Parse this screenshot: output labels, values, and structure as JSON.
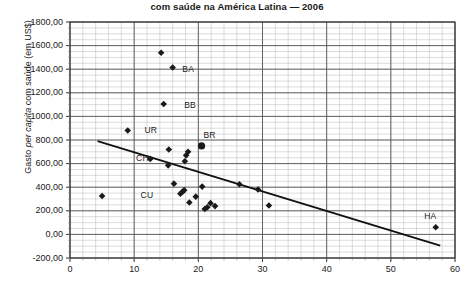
{
  "chart_data": {
    "type": "scatter",
    "title": "com saúde na América Latina — 2006",
    "xlabel": "",
    "ylabel": "Gasto per capita com saúde (em US$)",
    "xlim": [
      0,
      60
    ],
    "ylim": [
      -200,
      1800
    ],
    "xticks": [
      0,
      10,
      20,
      30,
      40,
      50,
      60
    ],
    "xtick_labels": [
      "0",
      "10",
      "20",
      "30",
      "40",
      "50",
      "60"
    ],
    "yticks": [
      -200,
      0,
      200,
      400,
      600,
      800,
      1000,
      1200,
      1400,
      1600,
      1800
    ],
    "ytick_labels": [
      "-200,00",
      "0,00",
      "200,00",
      "400,00",
      "600,00",
      "800,00",
      "1000,00",
      "1200,00",
      "1400,00",
      "1600,00",
      "1800,00"
    ],
    "grid": true,
    "grid_minor_x_step": 2,
    "grid_minor_y_step": 50,
    "marker_color": "#1a1a1a",
    "line_color": "#111111",
    "points": [
      {
        "x": 5.0,
        "y": 325,
        "label": ""
      },
      {
        "x": 9.0,
        "y": 880,
        "label": ""
      },
      {
        "x": 12.5,
        "y": 640,
        "label": ""
      },
      {
        "x": 14.2,
        "y": 1540,
        "label": ""
      },
      {
        "x": 14.6,
        "y": 1105,
        "label": ""
      },
      {
        "x": 15.3,
        "y": 585,
        "label": ""
      },
      {
        "x": 15.4,
        "y": 720,
        "label": ""
      },
      {
        "x": 16.0,
        "y": 1415,
        "label": ""
      },
      {
        "x": 16.2,
        "y": 430,
        "label": ""
      },
      {
        "x": 17.2,
        "y": 345,
        "label": ""
      },
      {
        "x": 17.5,
        "y": 360,
        "label": ""
      },
      {
        "x": 17.8,
        "y": 375,
        "label": ""
      },
      {
        "x": 17.9,
        "y": 620,
        "label": ""
      },
      {
        "x": 18.1,
        "y": 670,
        "label": ""
      },
      {
        "x": 18.4,
        "y": 700,
        "label": ""
      },
      {
        "x": 18.6,
        "y": 270,
        "label": ""
      },
      {
        "x": 19.6,
        "y": 320,
        "label": ""
      },
      {
        "x": 20.5,
        "y": 750,
        "label": "BR",
        "big": true
      },
      {
        "x": 20.6,
        "y": 405,
        "label": ""
      },
      {
        "x": 21.0,
        "y": 215,
        "label": ""
      },
      {
        "x": 21.4,
        "y": 230,
        "label": ""
      },
      {
        "x": 21.9,
        "y": 265,
        "label": ""
      },
      {
        "x": 22.6,
        "y": 240,
        "label": ""
      },
      {
        "x": 26.4,
        "y": 425,
        "label": ""
      },
      {
        "x": 29.3,
        "y": 380,
        "label": ""
      },
      {
        "x": 31.0,
        "y": 245,
        "label": ""
      },
      {
        "x": 57.0,
        "y": 60,
        "label": "HA"
      }
    ],
    "point_labels": [
      {
        "text": "BA",
        "x": 17.5,
        "y": 1400
      },
      {
        "text": "BB",
        "x": 17.8,
        "y": 1090
      },
      {
        "text": "UR",
        "x": 11.6,
        "y": 880
      },
      {
        "text": "BR",
        "x": 20.8,
        "y": 840
      },
      {
        "text": "CH",
        "x": 10.3,
        "y": 645
      },
      {
        "text": "CU",
        "x": 11.0,
        "y": 330
      },
      {
        "text": "HA",
        "x": 55.2,
        "y": 150
      }
    ],
    "trendline": {
      "x0": 4.3,
      "y0": 790,
      "x1": 57.7,
      "y1": -95
    }
  }
}
